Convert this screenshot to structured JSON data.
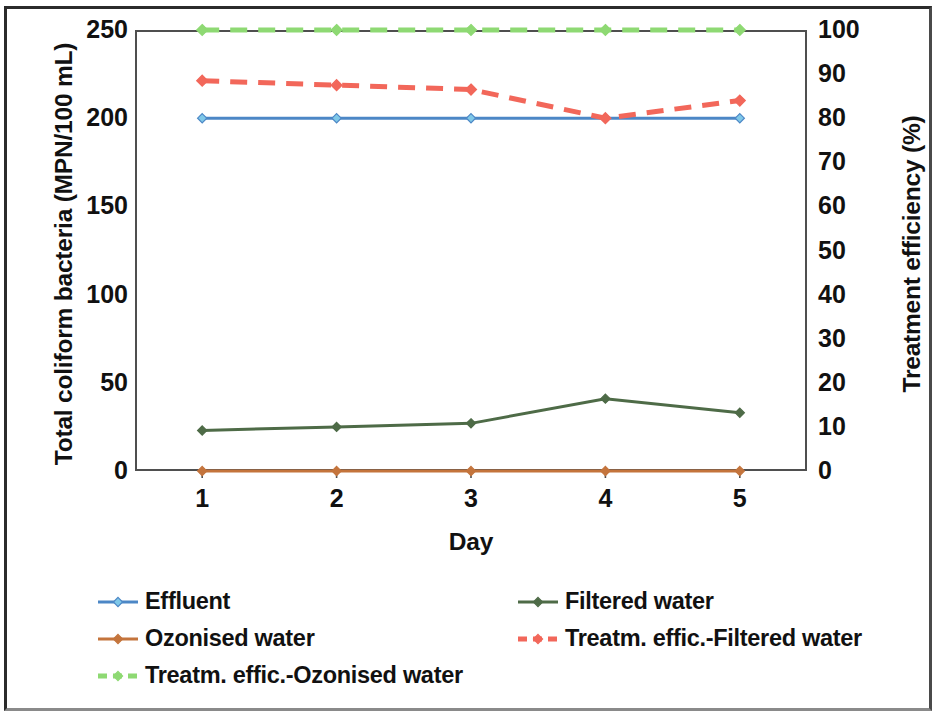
{
  "chart_data": {
    "type": "line",
    "title": "",
    "xlabel": "Day",
    "ylabel": "Total coliform bacteria (MPN/100 mL)",
    "y2label": "Treatment efficiency (%)",
    "x": [
      1,
      2,
      3,
      4,
      5
    ],
    "xtick_labels": [
      "1",
      "2",
      "3",
      "4",
      "5"
    ],
    "ylim": [
      0,
      250
    ],
    "ytick_labels": [
      "0",
      "50",
      "100",
      "150",
      "200",
      "250"
    ],
    "ytick_values": [
      0,
      50,
      100,
      150,
      200,
      250
    ],
    "y2lim": [
      0,
      100
    ],
    "y2tick_labels": [
      "0",
      "10",
      "20",
      "30",
      "40",
      "50",
      "60",
      "70",
      "80",
      "90",
      "100"
    ],
    "y2tick_values": [
      0,
      10,
      20,
      30,
      40,
      50,
      60,
      70,
      80,
      90,
      100
    ],
    "grid": false,
    "legend_position": "bottom",
    "series": [
      {
        "name": "Effluent",
        "axis": "left",
        "color": "#4C87C6",
        "marker_color": "#7FC8E8",
        "style": "solid",
        "marker": "diamond",
        "values": [
          200,
          200,
          200,
          200,
          200
        ]
      },
      {
        "name": "Filtered water",
        "axis": "left",
        "color": "#4E6B47",
        "marker_color": "#4E6B47",
        "style": "solid",
        "marker": "diamond",
        "values": [
          23,
          25,
          27,
          41,
          33
        ]
      },
      {
        "name": "Ozonised water",
        "axis": "left",
        "color": "#C4743C",
        "marker_color": "#C4743C",
        "style": "solid",
        "marker": "diamond",
        "values": [
          0,
          0,
          0,
          0,
          0
        ]
      },
      {
        "name": "Treatm. effic.-Filtered water",
        "axis": "right",
        "color": "#F2675A",
        "marker_color": "#F2675A",
        "style": "dashed",
        "marker": "diamond",
        "values": [
          88.5,
          87.5,
          86.5,
          80,
          84
        ]
      },
      {
        "name": "Treatm. effic.-Ozonised water",
        "axis": "right",
        "color": "#8ED973",
        "marker_color": "#8ED973",
        "style": "dashed",
        "marker": "diamond",
        "values": [
          100,
          100,
          100,
          100,
          100
        ]
      }
    ]
  },
  "legend": {
    "rows": [
      [
        "Effluent",
        "Filtered water"
      ],
      [
        "Ozonised water",
        "Treatm. effic.-Filtered water"
      ],
      [
        "Treatm. effic.-Ozonised water"
      ]
    ]
  }
}
